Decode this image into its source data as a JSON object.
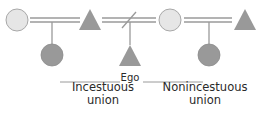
{
  "diagram": {
    "colors": {
      "female_fill": "#e6e6e6",
      "female_stroke": "#9a9a9a",
      "shape_fill": "#999999",
      "line": "#9a9a9a",
      "text": "#2a2a2a"
    },
    "nodes": [
      {
        "id": "f1",
        "shape": "circle",
        "fill": "light",
        "label": ""
      },
      {
        "id": "m1",
        "shape": "triangle",
        "fill": "dark",
        "label": ""
      },
      {
        "id": "f2",
        "shape": "circle",
        "fill": "light",
        "label": ""
      },
      {
        "id": "m2",
        "shape": "triangle",
        "fill": "dark",
        "label": ""
      },
      {
        "id": "c1",
        "shape": "circle",
        "fill": "dark",
        "label": ""
      },
      {
        "id": "ego",
        "shape": "triangle",
        "fill": "dark",
        "label": "Ego"
      },
      {
        "id": "c2",
        "shape": "circle",
        "fill": "dark",
        "label": ""
      }
    ],
    "edges": [
      {
        "type": "marriage",
        "from": "f1",
        "to": "m1"
      },
      {
        "type": "marriage-dissolved",
        "from": "m1",
        "to": "f2"
      },
      {
        "type": "marriage",
        "from": "f2",
        "to": "m2"
      },
      {
        "type": "descent",
        "from": "f1-m1",
        "to": "c1"
      },
      {
        "type": "descent",
        "from": "m1-f2",
        "to": "ego"
      },
      {
        "type": "descent",
        "from": "f2-m2",
        "to": "c2"
      }
    ],
    "labels": {
      "ego": "Ego",
      "incestuous_line1": "Incestuous",
      "incestuous_line2": "union",
      "nonincestuous_line1": "Nonincestuous",
      "nonincestuous_line2": "union"
    }
  }
}
